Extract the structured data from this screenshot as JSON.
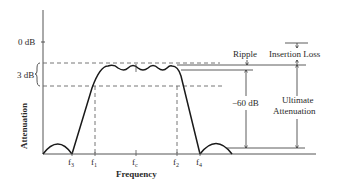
{
  "diagram": {
    "y_axis_label": "Attenuation",
    "x_axis_label": "Frequency",
    "y_ticks": {
      "zero": "0 dB",
      "three": "3 dB"
    },
    "x_ticks": [
      {
        "base": "f",
        "sub": "3"
      },
      {
        "base": "f",
        "sub": "1"
      },
      {
        "base": "f",
        "sub": "c"
      },
      {
        "base": "f",
        "sub": "2"
      },
      {
        "base": "f",
        "sub": "4"
      }
    ],
    "annotations": {
      "ripple": "Ripple",
      "insertion_loss": "Insertion Loss",
      "sixty_db": "−60 dB",
      "ultimate_line1": "Ultimate",
      "ultimate_line2": "Attenuation"
    },
    "colors": {
      "curve": "#1a1a1a",
      "axis": "#555555",
      "dashed": "#666666"
    }
  }
}
